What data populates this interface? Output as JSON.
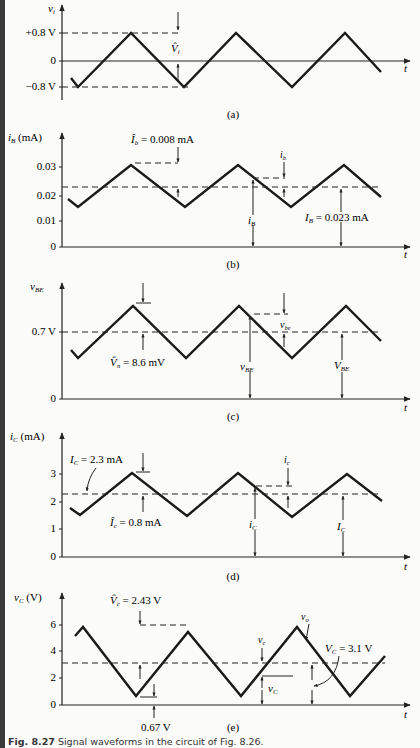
{
  "figure": {
    "caption_label": "Fig. 8.27",
    "caption_text": "Signal waveforms in the circuit of Fig. 8.26."
  },
  "chart_data": [
    {
      "type": "line",
      "panel": "(a)",
      "ylabel": "v_i",
      "xlabel": "t",
      "yticks": [
        "+0.8 V",
        "0",
        "−0.8 V"
      ],
      "ytick_values": [
        0.8,
        0,
        -0.8
      ],
      "wave": "triangle",
      "peak": 0.8,
      "trough": -0.8,
      "dc": 0,
      "annotations": [
        "V̂_i"
      ],
      "pixel": {
        "axisX": 62,
        "top": 5,
        "bottom": 100,
        "xEnd": 410,
        "zeroY": 61,
        "ticks": [
          33,
          61,
          87
        ],
        "points": [
          [
            71,
            78
          ],
          [
            78,
            87
          ],
          [
            131,
            33
          ],
          [
            184,
            87
          ],
          [
            236,
            33
          ],
          [
            292,
            87
          ],
          [
            345,
            33
          ],
          [
            381,
            72
          ]
        ],
        "label": [
          205,
          118
        ]
      }
    },
    {
      "type": "line",
      "panel": "(b)",
      "ylabel": "i_B (mA)",
      "xlabel": "t",
      "yticks": [
        "0.03",
        "0.02",
        "0.01",
        "0"
      ],
      "ytick_values": [
        0.03,
        0.02,
        0.01,
        0
      ],
      "wave": "triangle",
      "peak": 0.031,
      "trough": 0.015,
      "dc": 0.023,
      "annotations": [
        "Î_b = 0.008 mA",
        "i_b",
        "i_B",
        "I_B = 0.023 mA"
      ],
      "pixel": {
        "axisX": 62,
        "top": 133,
        "bottom": 247,
        "xEnd": 410,
        "zeroY": 247,
        "ticks": [
          167,
          196,
          221,
          247
        ],
        "dcY": 187,
        "points": [
          [
            68,
            199
          ],
          [
            78,
            207
          ],
          [
            131,
            165
          ],
          [
            185,
            207
          ],
          [
            238,
            165
          ],
          [
            291,
            207
          ],
          [
            344,
            165
          ],
          [
            381,
            197
          ]
        ],
        "label": [
          233,
          268
        ]
      }
    },
    {
      "type": "line",
      "panel": "(c)",
      "ylabel": "v_BE",
      "xlabel": "t",
      "yticks": [
        "0.7 V",
        "0"
      ],
      "ytick_values": [
        0.7,
        0
      ],
      "wave": "triangle",
      "dc": 0.7,
      "annotations": [
        "V̂_π = 8.6 mV",
        "v_be",
        "v_BE",
        "V_BE"
      ],
      "pixel": {
        "axisX": 62,
        "top": 283,
        "bottom": 399,
        "xEnd": 410,
        "zeroY": 399,
        "ticks": [
          332,
          399
        ],
        "dcY": 332,
        "points": [
          [
            71,
            350
          ],
          [
            78,
            358
          ],
          [
            133,
            306
          ],
          [
            186,
            358
          ],
          [
            239,
            306
          ],
          [
            292,
            358
          ],
          [
            346,
            306
          ],
          [
            381,
            341
          ]
        ],
        "label": [
          233,
          420
        ]
      }
    },
    {
      "type": "line",
      "panel": "(d)",
      "ylabel": "i_C (mA)",
      "xlabel": "t",
      "yticks": [
        "3",
        "2",
        "1",
        "0"
      ],
      "ytick_values": [
        3,
        2,
        1,
        0
      ],
      "wave": "triangle",
      "peak": 3.0,
      "trough": 1.5,
      "dc": 2.3,
      "annotations": [
        "I_C = 2.3 mA",
        "Î_c = 0.8 mA",
        "i_c",
        "i_C",
        "I_C"
      ],
      "pixel": {
        "axisX": 62,
        "top": 433,
        "bottom": 557,
        "xEnd": 410,
        "zeroY": 557,
        "ticks": [
          474,
          502,
          529,
          557
        ],
        "dcY": 494,
        "points": [
          [
            70,
            508
          ],
          [
            80,
            515
          ],
          [
            132,
            473
          ],
          [
            187,
            516
          ],
          [
            238,
            473
          ],
          [
            292,
            517
          ],
          [
            347,
            474
          ],
          [
            382,
            501
          ]
        ],
        "label": [
          233,
          580
        ]
      }
    },
    {
      "type": "line",
      "panel": "(e)",
      "ylabel": "v_C (V)",
      "xlabel": "t",
      "yticks": [
        "6",
        "4",
        "2",
        "0"
      ],
      "ytick_values": [
        6,
        4,
        2,
        0
      ],
      "wave": "triangle",
      "peak": 5.53,
      "trough": 0.67,
      "dc": 3.1,
      "annotations": [
        "V̂_c = 2.43 V",
        "v_o",
        "v_c",
        "V_C = 3.1 V",
        "v_C",
        "0.67 V"
      ],
      "pixel": {
        "axisX": 62,
        "top": 593,
        "bottom": 705,
        "xEnd": 410,
        "zeroY": 705,
        "ticks": [
          625,
          651,
          678,
          705
        ],
        "dcY": 663,
        "points": [
          [
            75,
            636
          ],
          [
            83,
            627
          ],
          [
            136,
            696
          ],
          [
            188,
            632
          ],
          [
            241,
            696
          ],
          [
            297,
            627
          ],
          [
            350,
            696
          ],
          [
            385,
            656
          ]
        ],
        "label": [
          233,
          727
        ]
      }
    }
  ],
  "labels": {
    "a": {
      "y_title": "v",
      "y_sub": "i",
      "t": "t",
      "vi_hat": "V̂",
      "vi_sub": "i",
      "panel": "(a)"
    },
    "b": {
      "y_title": "i",
      "y_sub": "B",
      "y_unit": " (mA)",
      "ib_hat": "Î",
      "ib_hat_sub": "b",
      "ib_hat_val": " = 0.008 mA",
      "ib": "i",
      "ib_sub": "b",
      "iB": "i",
      "iB_sub": "B",
      "IB": "I",
      "IB_sub": "B",
      "IB_val": " = 0.023 mA",
      "t": "t",
      "panel": "(b)"
    },
    "c": {
      "y_title": "v",
      "y_sub": "BE",
      "vpi": "V̂",
      "vpi_sub": "π",
      "vpi_val": " = 8.6 mV",
      "vbe": "v",
      "vbe_sub": "be",
      "vBE": "v",
      "vBE_sub": "BE",
      "VBE": "V",
      "VBE_sub": "BE",
      "t": "t",
      "panel": "(c)"
    },
    "d": {
      "y_title": "i",
      "y_sub": "C",
      "y_unit": " (mA)",
      "IC": "I",
      "IC_sub": "C",
      "IC_val": " = 2.3 mA",
      "Ic_hat": "Î",
      "Ic_hat_sub": "c",
      "Ic_hat_val": " = 0.8 mA",
      "ic": "i",
      "ic_sub": "c",
      "iC": "i",
      "iC_sub": "C",
      "IC2": "I",
      "IC2_sub": "C",
      "t": "t",
      "panel": "(d)"
    },
    "e": {
      "y_title": "v",
      "y_sub": "C",
      "y_unit": " (V)",
      "Vc_hat": "V̂",
      "Vc_hat_sub": "c",
      "Vc_hat_val": " = 2.43 V",
      "vo": "v",
      "vo_sub": "o",
      "vc": "v",
      "vc_sub": "c",
      "VC": "V",
      "VC_sub": "C",
      "VC_val": " = 3.1 V",
      "vC": "v",
      "vC_sub": "C",
      "min_val": "0.67 V",
      "t": "t",
      "panel": "(e)"
    }
  }
}
